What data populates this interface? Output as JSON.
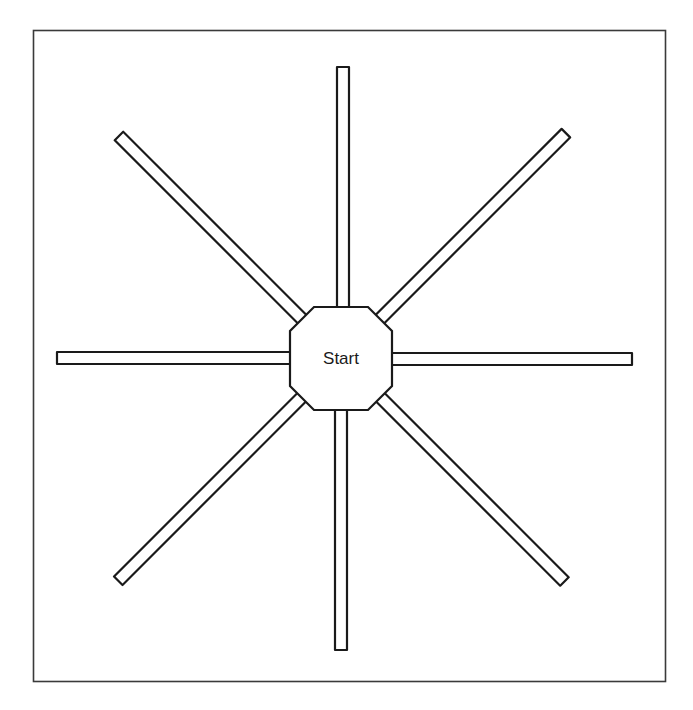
{
  "diagram": {
    "hub_label": "Start",
    "arm_count": 8,
    "arms": [
      {
        "id": "arm-north",
        "direction": "N",
        "angle_deg": 270
      },
      {
        "id": "arm-northeast",
        "direction": "NE",
        "angle_deg": 315
      },
      {
        "id": "arm-east",
        "direction": "E",
        "angle_deg": 0
      },
      {
        "id": "arm-southeast",
        "direction": "SE",
        "angle_deg": 45
      },
      {
        "id": "arm-south",
        "direction": "S",
        "angle_deg": 90
      },
      {
        "id": "arm-southwest",
        "direction": "SW",
        "angle_deg": 135
      },
      {
        "id": "arm-west",
        "direction": "W",
        "angle_deg": 180
      },
      {
        "id": "arm-northwest",
        "direction": "NW",
        "angle_deg": 225
      }
    ],
    "colors": {
      "stroke": "#1a1a1a",
      "fill": "#ffffff",
      "frame": "#3a3a3a"
    }
  }
}
